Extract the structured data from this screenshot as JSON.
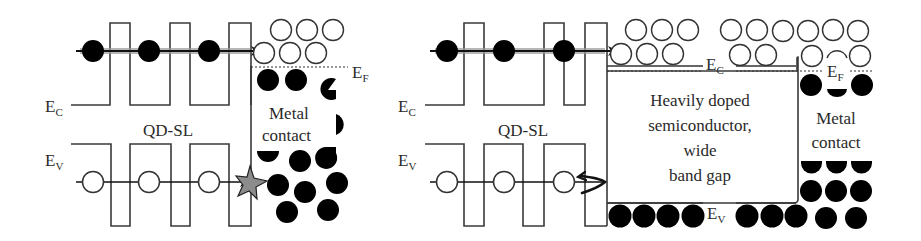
{
  "colors": {
    "line": "#3a3a3a",
    "electron_fill": "#000000",
    "hole_fill": "#ffffff",
    "text": "#2a2a2a",
    "transport_glow": "#9a9a9a",
    "star_fill": "#8c8c8c",
    "background": "#ffffff"
  },
  "left_panel": {
    "ec_label": {
      "main": "E",
      "sub": "C"
    },
    "ev_label": {
      "main": "E",
      "sub": "V"
    },
    "ef_label": {
      "main": "E",
      "sub": "F"
    },
    "region_label": "QD-SL",
    "metal_label_line1": "Metal",
    "metal_label_line2": "contact",
    "carriers": {
      "conduction_electrons_in_qd": 3,
      "valence_holes_in_qd": 3
    },
    "recombination_marker": "star-icon"
  },
  "right_panel": {
    "ec_label": {
      "main": "E",
      "sub": "C"
    },
    "ev_label": {
      "main": "E",
      "sub": "V"
    },
    "ec_label_mid": {
      "main": "E",
      "sub": "C"
    },
    "ev_label_mid": {
      "main": "E",
      "sub": "V"
    },
    "ef_label": {
      "main": "E",
      "sub": "F"
    },
    "region_label": "QD-SL",
    "semiconductor_label_line1": "Heavily doped",
    "semiconductor_label_line2": "semiconductor,",
    "semiconductor_label_line3": "wide",
    "semiconductor_label_line4": "band gap",
    "metal_label_line1": "Metal",
    "metal_label_line2": "contact",
    "carriers": {
      "conduction_electrons_in_qd": 3,
      "valence_holes_in_qd": 3
    },
    "reflection_marker": "reflect-arrow-icon"
  }
}
